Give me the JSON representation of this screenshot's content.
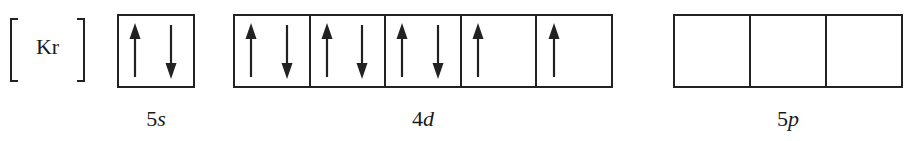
{
  "core": {
    "symbol": "Kr"
  },
  "subshells": [
    {
      "id": "5s",
      "n": "5",
      "l": "s",
      "orbitals": [
        [
          "up",
          "down"
        ]
      ]
    },
    {
      "id": "4d",
      "n": "4",
      "l": "d",
      "orbitals": [
        [
          "up",
          "down"
        ],
        [
          "up",
          "down"
        ],
        [
          "up",
          "down"
        ],
        [
          "up"
        ],
        [
          "up"
        ]
      ]
    },
    {
      "id": "5p",
      "n": "5",
      "l": "p",
      "orbitals": [
        [],
        [],
        []
      ]
    }
  ],
  "colors": {
    "line": "#222222",
    "background": "#ffffff"
  }
}
